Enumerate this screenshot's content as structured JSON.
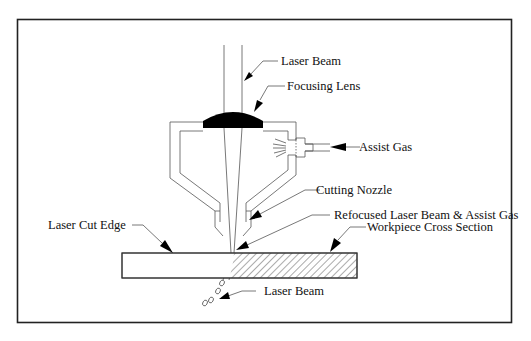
{
  "diagram": {
    "labels": {
      "laser_beam_top": "Laser Beam",
      "focusing_lens": "Focusing Lens",
      "assist_gas": "Assist Gas",
      "cutting_nozzle": "Cutting Nozzle",
      "refocused_beam": "Refocused Laser Beam & Assist Gas",
      "workpiece": "Workpiece Cross Section",
      "laser_cut_edge": "Laser Cut Edge",
      "laser_beam_bottom": "Laser Beam"
    },
    "colors": {
      "line": "#333333",
      "lens": "#000000",
      "frame": "#222222",
      "background": "#ffffff"
    }
  }
}
